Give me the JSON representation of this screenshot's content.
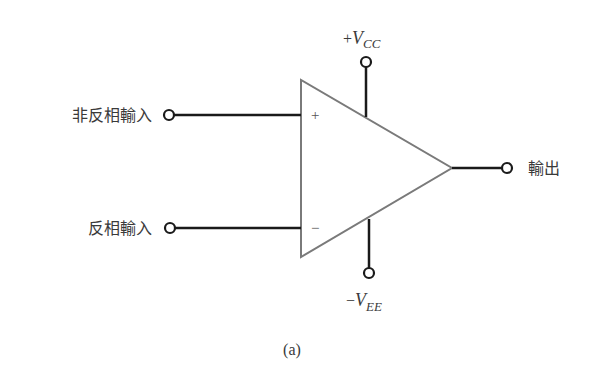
{
  "diagram": {
    "type": "op-amp-symbol",
    "labels": {
      "non_inverting_input": "非反相輸入",
      "inverting_input": "反相輸入",
      "output": "輸出",
      "positive_supply_prefix": "+",
      "positive_supply_main": "V",
      "positive_supply_sub": "CC",
      "negative_supply_prefix": "−",
      "negative_supply_main": "V",
      "negative_supply_sub": "EE",
      "plus_sign": "+",
      "minus_sign": "−",
      "caption": "(a)"
    },
    "colors": {
      "wire": "#1a1a1a",
      "triangle": "#7a7a7a",
      "text": "#3a3a3a"
    }
  }
}
